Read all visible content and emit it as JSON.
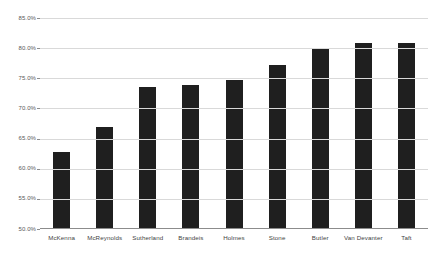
{
  "chart_data": {
    "type": "bar",
    "title": "",
    "subtitle": "",
    "xlabel": "",
    "ylabel": "",
    "categories": [
      "McKenna",
      "McReynolds",
      "Sutherland",
      "Brandeis",
      "Holmes",
      "Stone",
      "Butler",
      "Van Devanter",
      "Taft"
    ],
    "values": [
      62.8,
      67.0,
      73.6,
      73.9,
      74.8,
      77.2,
      80.0,
      80.8,
      80.8
    ],
    "value_format": "percent",
    "ylim": [
      50.0,
      85.0
    ],
    "ytick_labels": [
      "85.0%",
      "80.0%",
      "75.0%",
      "70.0%",
      "65.0%",
      "60.0%",
      "55.0%",
      "50.0%"
    ],
    "ytick_values": [
      85.0,
      80.0,
      75.0,
      70.0,
      65.0,
      60.0,
      55.0,
      50.0
    ],
    "grid": true,
    "legend": null,
    "legend_position": "none",
    "series": [
      {
        "name": "",
        "values": [
          62.8,
          67.0,
          73.6,
          73.9,
          74.8,
          77.2,
          80.0,
          80.8,
          80.8
        ]
      }
    ],
    "colors": {
      "bar": "#1f1f1f",
      "gridline": "#d9d9d9",
      "axis": "#8c8c8c",
      "tick_label": "#595959",
      "category_label": "#3f3f3f",
      "background": "#ffffff"
    }
  }
}
